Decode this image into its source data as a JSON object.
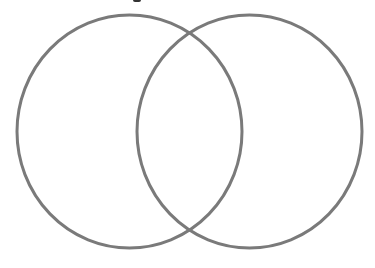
{
  "diagram": {
    "type": "venn",
    "sets": [
      {
        "id": "left",
        "label": "",
        "cx": 129.5,
        "cy": 131.5,
        "rx": 112.5,
        "ry": 116.5
      },
      {
        "id": "right",
        "label": "",
        "cx": 249.5,
        "cy": 131.5,
        "rx": 112.5,
        "ry": 116.5
      }
    ],
    "intersection_points": [
      {
        "x": 189,
        "y": 33
      },
      {
        "x": 190,
        "y": 229
      }
    ],
    "stroke_color": "#7a7a7a",
    "stroke_width": 3,
    "background_color": "#ffffff",
    "regions": {
      "left_only": "",
      "overlap": "",
      "right_only": ""
    }
  }
}
